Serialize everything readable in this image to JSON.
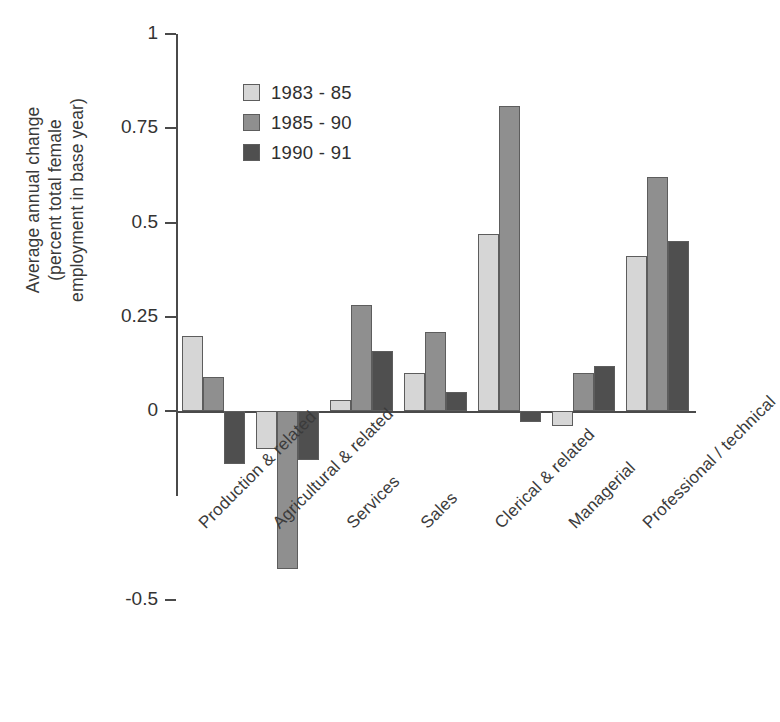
{
  "chart_data": {
    "type": "bar",
    "title": "",
    "xlabel": "",
    "ylabel": "Average annual change (percent total female employment in base year)",
    "ylabel_lines": [
      "Average annual change",
      "(percent total female",
      "employment in base year)"
    ],
    "ylim": [
      -0.5,
      1
    ],
    "yticks": [
      1,
      0.75,
      0.5,
      0.25,
      0,
      -0.5
    ],
    "ytick_labels": [
      "1",
      "0.75",
      "0.5",
      "0.25",
      "0",
      "-0.5"
    ],
    "grid": false,
    "legend_position": "upper-center",
    "categories": [
      "Production & related",
      "Agricultural & related",
      "Services",
      "Sales",
      "Clerical & related",
      "Managerial",
      "Professional / technical"
    ],
    "series": [
      {
        "name": "1983 - 85",
        "color": "#d6d6d6",
        "values": [
          0.2,
          -0.1,
          0.03,
          0.1,
          0.47,
          -0.04,
          0.41
        ]
      },
      {
        "name": "1985 - 90",
        "color": "#8f8f8f",
        "values": [
          0.09,
          -0.42,
          0.28,
          0.21,
          0.81,
          0.1,
          0.62
        ]
      },
      {
        "name": "1990 - 91",
        "color": "#4f4f4f",
        "values": [
          -0.14,
          -0.13,
          0.16,
          0.05,
          -0.03,
          0.12,
          0.45
        ]
      }
    ]
  },
  "legend": {
    "items": [
      {
        "label": "1983 - 85",
        "color": "#d6d6d6"
      },
      {
        "label": "1985 - 90",
        "color": "#8f8f8f"
      },
      {
        "label": "1990 - 91",
        "color": "#4f4f4f"
      }
    ]
  },
  "axis": {
    "y_labels": [
      "1",
      "0.75",
      "0.5",
      "0.25",
      "0",
      "-0.5"
    ],
    "y_title_lines": [
      "Average annual change",
      "(percent total female",
      "employment in base year)"
    ]
  }
}
